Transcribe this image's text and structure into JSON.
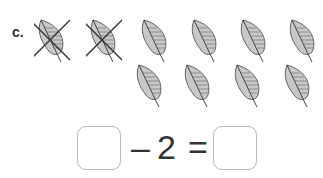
{
  "problem": {
    "label": "c.",
    "total_leaves": 10,
    "crossed_out": 2
  },
  "equation": {
    "first_box": "",
    "operator": "–",
    "subtrahend": "2",
    "equals": "=",
    "answer_box": ""
  },
  "leaves": [
    {
      "x": 34,
      "y": 18,
      "crossed": true
    },
    {
      "x": 86,
      "y": 18,
      "crossed": true
    },
    {
      "x": 137,
      "y": 18,
      "crossed": false
    },
    {
      "x": 187,
      "y": 18,
      "crossed": false
    },
    {
      "x": 236,
      "y": 18,
      "crossed": false
    },
    {
      "x": 285,
      "y": 18,
      "crossed": false
    },
    {
      "x": 132,
      "y": 63,
      "crossed": false
    },
    {
      "x": 180,
      "y": 63,
      "crossed": false
    },
    {
      "x": 230,
      "y": 63,
      "crossed": false
    },
    {
      "x": 280,
      "y": 63,
      "crossed": false
    }
  ]
}
